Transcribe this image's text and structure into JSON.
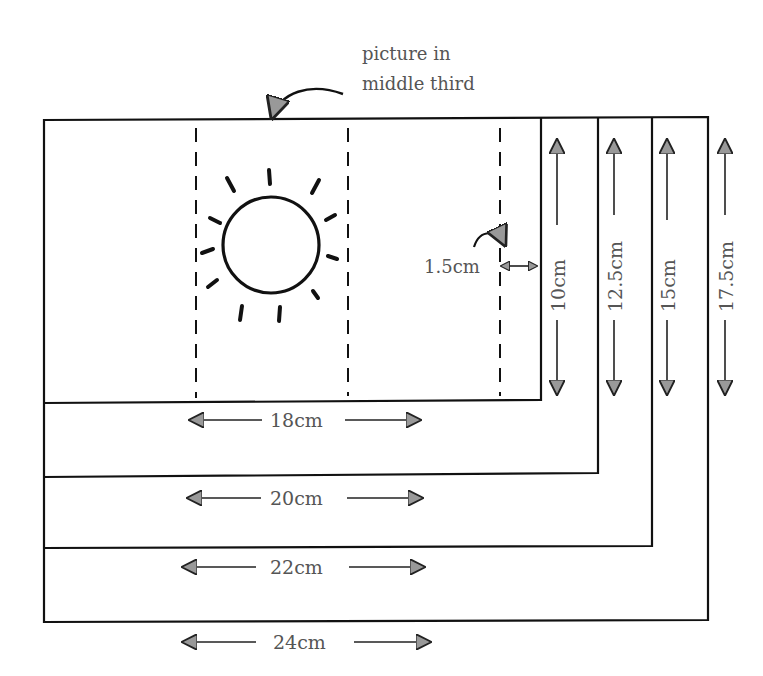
{
  "diagram": {
    "title_note": {
      "line1": "picture in",
      "line2": "middle third"
    },
    "margin_label": "1.5cm",
    "rectangles": [
      {
        "width_label": "18cm",
        "height_label": "10cm"
      },
      {
        "width_label": "20cm",
        "height_label": "12.5cm"
      },
      {
        "width_label": "22cm",
        "height_label": "15cm"
      },
      {
        "width_label": "24cm",
        "height_label": "17.5cm"
      }
    ],
    "icons": [
      "sun-icon",
      "curved-arrow-icon",
      "double-arrow-icon"
    ],
    "colors": {
      "line": "#111111",
      "text": "#555555",
      "background": "#ffffff"
    }
  }
}
